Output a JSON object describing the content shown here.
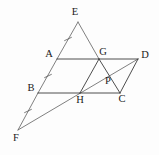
{
  "figure": {
    "background_color": "#fdfdfd",
    "line_color": "#3a3a3a",
    "label_color": "#1a1a1a",
    "points": {
      "E": {
        "label": "E",
        "x": 78,
        "y": 22,
        "label_x": 75,
        "label_y": 13
      },
      "A": {
        "label": "A",
        "x": 57,
        "y": 59,
        "label_x": 49,
        "label_y": 55
      },
      "G": {
        "label": "G",
        "x": 99,
        "y": 59,
        "label_x": 103,
        "label_y": 53
      },
      "D": {
        "label": "D",
        "x": 138,
        "y": 59,
        "label_x": 145,
        "label_y": 56
      },
      "B": {
        "label": "B",
        "x": 38,
        "y": 93,
        "label_x": 31,
        "label_y": 89
      },
      "H": {
        "label": "H",
        "x": 80,
        "y": 93,
        "label_x": 80,
        "label_y": 101
      },
      "C": {
        "label": "C",
        "x": 120,
        "y": 93,
        "label_x": 122,
        "label_y": 100
      },
      "P": {
        "label": "P",
        "x": 110,
        "y": 82,
        "label_x": 108,
        "label_y": 82
      },
      "F": {
        "label": "F",
        "x": 18,
        "y": 130,
        "label_x": 16,
        "label_y": 139
      }
    },
    "segments": [
      {
        "name": "segment-A-G",
        "from": "A",
        "to": "G"
      },
      {
        "name": "segment-G-D",
        "from": "G",
        "to": "D"
      },
      {
        "name": "segment-B-H",
        "from": "B",
        "to": "H"
      },
      {
        "name": "segment-H-C",
        "from": "H",
        "to": "C"
      },
      {
        "name": "segment-A-B",
        "from": "A",
        "to": "B"
      },
      {
        "name": "segment-G-H",
        "from": "G",
        "to": "H"
      },
      {
        "name": "segment-D-C",
        "from": "D",
        "to": "C"
      },
      {
        "name": "segment-E-A",
        "from": "E",
        "to": "A"
      },
      {
        "name": "segment-E-G",
        "from": "E",
        "to": "G"
      },
      {
        "name": "segment-B-F",
        "from": "B",
        "to": "F"
      },
      {
        "name": "segment-F-D",
        "from": "F",
        "to": "D"
      },
      {
        "name": "segment-G-C",
        "from": "G",
        "to": "C"
      }
    ],
    "tick_marks": [
      {
        "name": "tick-on-AE",
        "x": 68,
        "y": 39,
        "angle": 26
      },
      {
        "name": "tick-on-AB",
        "x": 48,
        "y": 76,
        "angle": 26
      },
      {
        "name": "tick-on-BF",
        "x": 28,
        "y": 111,
        "angle": 26
      }
    ]
  }
}
